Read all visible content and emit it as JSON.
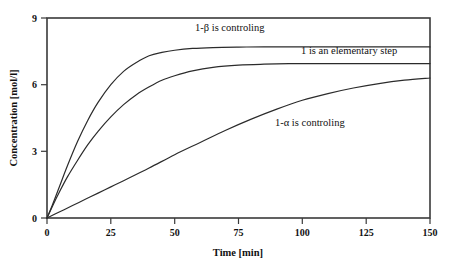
{
  "chart_data": {
    "type": "line",
    "title": "",
    "xlabel": "Time [min]",
    "ylabel": "Concentration [mol/l]",
    "xlim": [
      0,
      150
    ],
    "ylim": [
      0,
      9
    ],
    "xticks": [
      "0",
      "25",
      "50",
      "75",
      "100",
      "125",
      "150"
    ],
    "xtick_values": [
      0,
      25,
      50,
      75,
      100,
      125,
      150
    ],
    "yticks": [
      "0",
      "3",
      "6",
      "9"
    ],
    "ytick_values": [
      0,
      3,
      6,
      9
    ],
    "grid": false,
    "legend_position": "inline-annotations",
    "series": [
      {
        "name": "1-β is controling",
        "color": "#2b2b2b",
        "plateau": 7.7,
        "x": [
          0,
          2,
          5,
          8,
          12,
          16,
          20,
          25,
          30,
          35,
          40,
          45,
          50,
          57,
          65,
          75,
          85,
          100,
          115,
          130,
          150
        ],
        "values": [
          0,
          0.55,
          1.45,
          2.35,
          3.45,
          4.4,
          5.2,
          6.0,
          6.6,
          7.0,
          7.3,
          7.45,
          7.55,
          7.63,
          7.67,
          7.69,
          7.7,
          7.7,
          7.7,
          7.7,
          7.7
        ]
      },
      {
        "name": "1 is an elementary step",
        "color": "#2b2b2b",
        "plateau": 6.95,
        "x": [
          0,
          2,
          5,
          8,
          12,
          16,
          20,
          25,
          30,
          35,
          40,
          45,
          50,
          57,
          65,
          75,
          85,
          100,
          115,
          130,
          150
        ],
        "values": [
          0,
          0.5,
          1.2,
          1.85,
          2.6,
          3.3,
          3.9,
          4.55,
          5.1,
          5.55,
          5.9,
          6.2,
          6.4,
          6.62,
          6.78,
          6.88,
          6.92,
          6.95,
          6.95,
          6.95,
          6.95
        ]
      },
      {
        "name": "1-α is controling",
        "color": "#2b2b2b",
        "plateau": 6.3,
        "x": [
          0,
          5,
          10,
          15,
          20,
          25,
          30,
          40,
          50,
          60,
          70,
          80,
          90,
          100,
          110,
          120,
          130,
          140,
          150
        ],
        "values": [
          0,
          0.28,
          0.56,
          0.84,
          1.12,
          1.4,
          1.68,
          2.25,
          2.85,
          3.4,
          3.95,
          4.45,
          4.9,
          5.3,
          5.6,
          5.85,
          6.05,
          6.2,
          6.3
        ]
      }
    ],
    "annotations": [
      {
        "text": "1-β is controling",
        "x_px": 195,
        "y_px": 31,
        "anchor": "start"
      },
      {
        "text": "1 is an elementary step",
        "x_px": 301,
        "y_px": 54,
        "anchor": "start"
      },
      {
        "text": "1-α is controling",
        "x_px": 275,
        "y_px": 126,
        "anchor": "start"
      }
    ]
  }
}
